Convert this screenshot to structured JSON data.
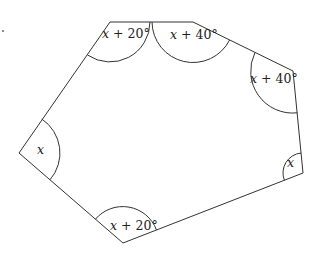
{
  "diagram": {
    "type": "hexagon-interior-angles",
    "stroke_color": "#333333",
    "background": "#ffffff",
    "vertices": [
      {
        "id": "top-left",
        "x": 110,
        "y": 22,
        "angle_label": "x + 20°"
      },
      {
        "id": "top-right",
        "x": 193,
        "y": 22,
        "angle_label": "x + 40°"
      },
      {
        "id": "right-upper",
        "x": 293,
        "y": 71,
        "angle_label": "x + 40°"
      },
      {
        "id": "right-lower",
        "x": 303,
        "y": 173,
        "angle_label": "x"
      },
      {
        "id": "bottom",
        "x": 123,
        "y": 243,
        "angle_label": "x + 20°"
      },
      {
        "id": "left",
        "x": 19,
        "y": 153,
        "angle_label": "x"
      }
    ],
    "labels": {
      "top_left": "x + 20°",
      "top_right": "x + 40°",
      "right_upper": "x + 40°",
      "right_lower": "x",
      "bottom": "x + 20°",
      "left": "x"
    }
  }
}
